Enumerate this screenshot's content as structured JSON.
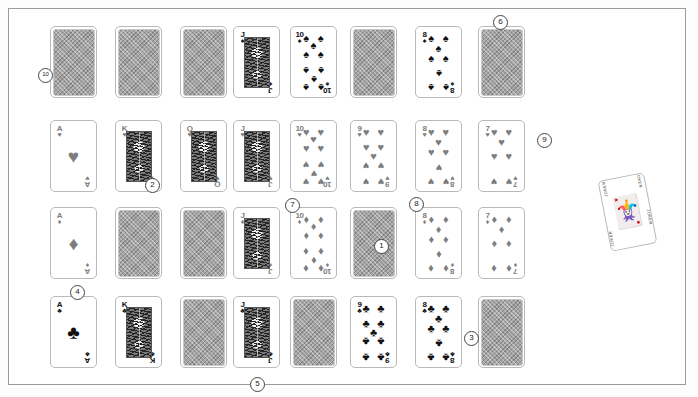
{
  "scene": {
    "title": "Playing card deck layout",
    "background_color": "#ffffff",
    "frame_color": "#9b9b9b",
    "black_suit_color": "#111111",
    "red_suit_color": "#7d7d7d",
    "card_back_color": "#a5a5a5"
  },
  "suits": {
    "spade": "♠",
    "heart": "♥",
    "diamond": "♦",
    "club": "♣"
  },
  "rows": [
    {
      "suit_name": "spades",
      "suit": "♠",
      "color": "black",
      "cards": [
        {
          "rank": "A",
          "face_up": false
        },
        {
          "rank": "K",
          "face_up": false
        },
        {
          "rank": "Q",
          "face_up": false
        },
        {
          "rank": "J",
          "face_up": true,
          "court": true
        },
        {
          "rank": "10",
          "face_up": true
        },
        {
          "rank": "9",
          "face_up": false
        },
        {
          "rank": "8",
          "face_up": true
        },
        {
          "rank": "7",
          "face_up": false
        }
      ]
    },
    {
      "suit_name": "hearts",
      "suit": "♥",
      "color": "red",
      "cards": [
        {
          "rank": "A",
          "face_up": true,
          "ace": true
        },
        {
          "rank": "K",
          "face_up": true,
          "court": true
        },
        {
          "rank": "Q",
          "face_up": true,
          "court": true
        },
        {
          "rank": "J",
          "face_up": true,
          "court": true
        },
        {
          "rank": "10",
          "face_up": true
        },
        {
          "rank": "9",
          "face_up": true
        },
        {
          "rank": "8",
          "face_up": true
        },
        {
          "rank": "7",
          "face_up": true
        }
      ]
    },
    {
      "suit_name": "diamonds",
      "suit": "♦",
      "color": "red",
      "cards": [
        {
          "rank": "A",
          "face_up": true,
          "ace": true
        },
        {
          "rank": "K",
          "face_up": false
        },
        {
          "rank": "Q",
          "face_up": false
        },
        {
          "rank": "J",
          "face_up": true,
          "court": true
        },
        {
          "rank": "10",
          "face_up": true
        },
        {
          "rank": "9",
          "face_up": false
        },
        {
          "rank": "8",
          "face_up": true
        },
        {
          "rank": "7",
          "face_up": true
        }
      ]
    },
    {
      "suit_name": "clubs",
      "suit": "♣",
      "color": "black",
      "cards": [
        {
          "rank": "A",
          "face_up": true,
          "ace": true
        },
        {
          "rank": "K",
          "face_up": true,
          "court": true
        },
        {
          "rank": "Q",
          "face_up": false
        },
        {
          "rank": "J",
          "face_up": true,
          "court": true
        },
        {
          "rank": "10",
          "face_up": false
        },
        {
          "rank": "9",
          "face_up": true
        },
        {
          "rank": "8",
          "face_up": true
        },
        {
          "rank": "7",
          "face_up": false
        }
      ]
    }
  ],
  "markers": [
    {
      "id": "m1",
      "label": "1",
      "x": 374,
      "y": 239
    },
    {
      "id": "m2",
      "label": "2",
      "x": 145,
      "y": 178
    },
    {
      "id": "m3",
      "label": "3",
      "x": 464,
      "y": 331
    },
    {
      "id": "m4",
      "label": "4",
      "x": 70,
      "y": 285
    },
    {
      "id": "m5",
      "label": "5",
      "x": 250,
      "y": 377
    },
    {
      "id": "m6",
      "label": "6",
      "x": 493,
      "y": 15
    },
    {
      "id": "m7",
      "label": "7",
      "x": 285,
      "y": 198
    },
    {
      "id": "m8",
      "label": "8",
      "x": 409,
      "y": 197
    },
    {
      "id": "m9",
      "label": "9",
      "x": 537,
      "y": 133
    },
    {
      "id": "m10",
      "label": "10",
      "x": 38,
      "y": 68
    }
  ],
  "joker": {
    "name": "joker-card",
    "corner_text": "JOKER",
    "figure": "🃏",
    "x": 604,
    "y": 176,
    "rotation_deg": -11
  }
}
